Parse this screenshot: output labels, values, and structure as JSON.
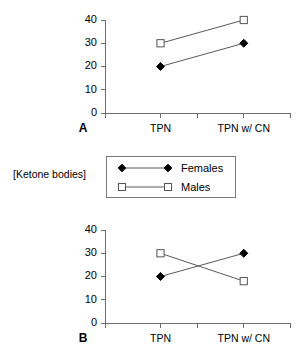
{
  "figure": {
    "y_axis_label": "[Ketone bodies]"
  },
  "legend": {
    "entries": [
      {
        "label": "Females",
        "marker": "filled-diamond",
        "color": "#000000"
      },
      {
        "label": "Males",
        "marker": "open-square",
        "color": "#555555"
      }
    ]
  },
  "panel_a": {
    "letter": "A"
  },
  "panel_b": {
    "letter": "B"
  },
  "chart_data": [
    {
      "type": "line",
      "panel": "A",
      "title": "",
      "xlabel": "",
      "ylabel": "[Ketone bodies]",
      "categories": [
        "TPN",
        "TPN w/ CN"
      ],
      "ylim": [
        0,
        40
      ],
      "yticks": [
        0,
        10,
        20,
        30,
        40
      ],
      "ytick_labels": [
        "0",
        "10",
        "20",
        "30",
        "40"
      ],
      "grid": false,
      "legend_position": "below-panel",
      "series": [
        {
          "name": "Females",
          "marker": "filled-diamond",
          "values": [
            20,
            30
          ]
        },
        {
          "name": "Males",
          "marker": "open-square",
          "values": [
            30,
            40
          ]
        }
      ]
    },
    {
      "type": "line",
      "panel": "B",
      "title": "",
      "xlabel": "",
      "ylabel": "[Ketone bodies]",
      "categories": [
        "TPN",
        "TPN w/ CN"
      ],
      "ylim": [
        0,
        40
      ],
      "yticks": [
        0,
        10,
        20,
        30,
        40
      ],
      "ytick_labels": [
        "0",
        "10",
        "20",
        "30",
        "40"
      ],
      "grid": false,
      "legend_position": "above-panel",
      "series": [
        {
          "name": "Females",
          "marker": "filled-diamond",
          "values": [
            20,
            30
          ]
        },
        {
          "name": "Males",
          "marker": "open-square",
          "values": [
            30,
            18
          ]
        }
      ]
    }
  ]
}
